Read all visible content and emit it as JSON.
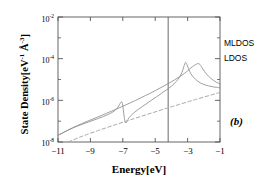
{
  "chart_data": {
    "type": "line",
    "title": "",
    "panel_label": "(b)",
    "xlabel": "Energy[eV]",
    "ylabel_text": "State Density[eV",
    "ylabel_exp1": "-1",
    "ylabel_mid": " Å",
    "ylabel_exp2": "-3",
    "ylabel_close": "]",
    "xlim": [
      -11,
      -1
    ],
    "ylim": [
      1e-08,
      0.01
    ],
    "yscale": "log",
    "grid": false,
    "xticks": [
      -11,
      -9,
      -7,
      -5,
      -3,
      -1
    ],
    "xtick_labels": [
      "−11",
      "−9",
      "−7",
      "−5",
      "−3",
      "−1"
    ],
    "yticks": [
      0.01,
      0.0001,
      1e-06,
      1e-08
    ],
    "ytick_labels": [
      "10",
      "10",
      "10",
      "10"
    ],
    "ytick_exponents": [
      "-2",
      "-4",
      "-6",
      "-8"
    ],
    "ytick_minor": [
      0.001,
      1e-05,
      1e-07
    ],
    "legend_position": "right-outside",
    "annotations": [
      {
        "name": "fermi-level-line",
        "type": "vline",
        "x": -4.2,
        "label": ""
      }
    ],
    "series": [
      {
        "name": "MLDOS",
        "style": "solid",
        "color": "#8c8c8c",
        "description": "Upper solid curve with Fano antiresonance near -7 eV and main peak near -3.2 eV",
        "x": [
          -11.0,
          -10.8,
          -10.6,
          -10.4,
          -10.2,
          -10.0,
          -9.7,
          -9.4,
          -9.1,
          -8.8,
          -8.5,
          -8.2,
          -7.9,
          -7.6,
          -7.4,
          -7.25,
          -7.15,
          -7.08,
          -7.02,
          -6.98,
          -6.94,
          -6.9,
          -6.86,
          -6.82,
          -6.78,
          -6.72,
          -6.6,
          -6.4,
          -6.1,
          -5.8,
          -5.5,
          -5.2,
          -4.9,
          -4.6,
          -4.3,
          -4.0,
          -3.7,
          -3.5,
          -3.35,
          -3.25,
          -3.18,
          -3.12,
          -3.05,
          -2.95,
          -2.8,
          -2.6,
          -2.4,
          -2.2,
          -2.0,
          -1.7,
          -1.4,
          -1.1,
          -1.0
        ],
        "y": [
          2.1e-08,
          2.5e-08,
          3e-08,
          3.6e-08,
          4.3e-08,
          5e-08,
          6.2e-08,
          7.6e-08,
          9.2e-08,
          1.12e-07,
          1.36e-07,
          1.68e-07,
          2.1e-07,
          2.8e-07,
          3.8e-07,
          5.4e-07,
          7.4e-07,
          8.6e-07,
          7e-07,
          4.2e-07,
          2.3e-07,
          1.35e-07,
          9.5e-08,
          8.2e-08,
          8.6e-08,
          1.05e-07,
          1.5e-07,
          2.2e-07,
          3.4e-07,
          5e-07,
          7.2e-07,
          1.05e-06,
          1.5e-06,
          2.2e-06,
          3.2e-06,
          4.8e-06,
          8e-06,
          1.3e-05,
          2.2e-05,
          3.8e-05,
          5.6e-05,
          6.6e-05,
          5.4e-05,
          3.4e-05,
          1.9e-05,
          1.2e-05,
          8.6e-06,
          6.8e-06,
          5.8e-06,
          4.9e-06,
          4.4e-06,
          4.1e-06,
          4e-06
        ]
      },
      {
        "name": "LDOS",
        "style": "solid",
        "color": "#8c8c8c",
        "description": "Lower smooth solid curve peaking near -2.3 eV",
        "x": [
          -11.0,
          -10.7,
          -10.4,
          -10.1,
          -9.8,
          -9.5,
          -9.2,
          -8.9,
          -8.6,
          -8.3,
          -8.0,
          -7.7,
          -7.4,
          -7.1,
          -6.8,
          -6.5,
          -6.2,
          -5.9,
          -5.6,
          -5.3,
          -5.0,
          -4.7,
          -4.4,
          -4.1,
          -3.8,
          -3.5,
          -3.2,
          -3.0,
          -2.8,
          -2.6,
          -2.45,
          -2.35,
          -2.28,
          -2.2,
          -2.1,
          -1.95,
          -1.8,
          -1.6,
          -1.4,
          -1.2,
          -1.0
        ],
        "y": [
          2.1e-08,
          2.8e-08,
          3.7e-08,
          4.8e-08,
          6.2e-08,
          7.8e-08,
          9.8e-08,
          1.22e-07,
          1.52e-07,
          1.9e-07,
          2.4e-07,
          3e-07,
          3.8e-07,
          4.8e-07,
          6.1e-07,
          7.8e-07,
          1e-06,
          1.3e-06,
          1.7e-06,
          2.2e-06,
          2.9e-06,
          3.9e-06,
          5.2e-06,
          7e-06,
          9.6e-06,
          1.35e-05,
          1.95e-05,
          2.6e-05,
          3.6e-05,
          4.7e-05,
          5.5e-05,
          5.8e-05,
          5.6e-05,
          4.8e-05,
          3.6e-05,
          2.4e-05,
          1.7e-05,
          1.2e-05,
          9e-06,
          7.2e-06,
          6.2e-06
        ]
      },
      {
        "name": "reference-dashed",
        "style": "dashed",
        "color": "#a8a8a8",
        "description": "Dashed reference line rising monotonically from lower-left to right",
        "x": [
          -10.35,
          -9.5,
          -8.5,
          -7.5,
          -6.5,
          -5.5,
          -4.5,
          -3.5,
          -2.5,
          -1.5,
          -1.0
        ],
        "y": [
          1e-08,
          1.9e-08,
          3.6e-08,
          6.6e-08,
          1.18e-07,
          2.1e-07,
          3.7e-07,
          6.4e-07,
          1.1e-06,
          1.85e-06,
          2.4e-06
        ]
      }
    ],
    "legend_entries": [
      {
        "label": "MLDOS",
        "series": "MLDOS"
      },
      {
        "label": "LDOS",
        "series": "LDOS"
      }
    ]
  },
  "plot_frame": {
    "left": 58,
    "right": 220,
    "top": 17,
    "bottom": 142
  },
  "colors": {
    "axis": "#555555",
    "curve": "#8c8c8c",
    "dashed": "#a8a8a8",
    "text": "#000000",
    "background": "#ffffff"
  }
}
